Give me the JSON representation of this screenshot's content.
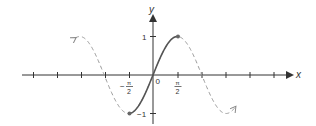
{
  "chart_data": {
    "type": "line",
    "title": "",
    "function": "y = sin x",
    "xlabel": "x",
    "ylabel": "y",
    "x_tick_labels": [
      "-π/2",
      "0",
      "π/2"
    ],
    "y_tick_labels": [
      "1",
      "-1"
    ],
    "ylim": [
      -1,
      1
    ],
    "xlim": [
      -5.0,
      5.3
    ],
    "grid": false,
    "legend": null,
    "series": [
      {
        "name": "restricted sine (solid)",
        "style": "solid",
        "domain": [
          -1.5708,
          1.5708
        ],
        "endpoints": [
          [
            -1.5708,
            -1
          ],
          [
            1.5708,
            1
          ]
        ]
      },
      {
        "name": "sine (dashed)",
        "style": "dashed",
        "domain": [
          -5.0,
          5.3
        ]
      }
    ]
  },
  "labels": {
    "x_axis": "x",
    "y_axis": "y",
    "origin": "0",
    "y_one": "1",
    "y_neg_one": "−1",
    "pi": "π",
    "two": "2",
    "minus": "−"
  },
  "colors": {
    "axis": "#333333",
    "solid_curve": "#555555",
    "dashed_curve": "#999999",
    "point": "#666666"
  }
}
